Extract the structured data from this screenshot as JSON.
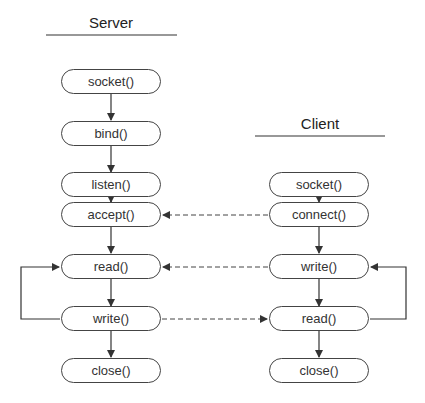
{
  "diagram": {
    "type": "flowchart",
    "server": {
      "title": "Server",
      "nodes": [
        "socket()",
        "bind()",
        "listen()",
        "accept()",
        "read()",
        "write()",
        "close()"
      ]
    },
    "client": {
      "title": "Client",
      "nodes": [
        "socket()",
        "connect()",
        "write()",
        "read()",
        "close()"
      ]
    },
    "edges": [
      {
        "from": "client.connect()",
        "to": "server.accept()",
        "style": "dashed"
      },
      {
        "from": "client.write()",
        "to": "server.read()",
        "style": "dashed"
      },
      {
        "from": "server.write()",
        "to": "client.read()",
        "style": "dashed"
      },
      {
        "from": "server.write()",
        "to": "server.read()",
        "style": "loop"
      },
      {
        "from": "client.read()",
        "to": "client.write()",
        "style": "loop"
      }
    ]
  }
}
